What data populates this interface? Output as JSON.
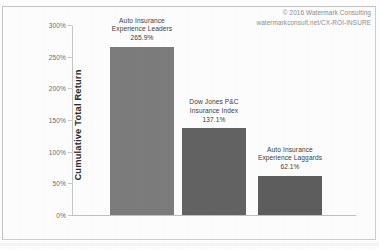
{
  "credit": {
    "copyright": "© 2016 Watermark Consulting",
    "url": "watermarkconsult.net/CX-ROI-INSURE"
  },
  "chart_data": {
    "type": "bar",
    "title": "",
    "xlabel": "",
    "ylabel": "Cumulative Total Return",
    "ylim": [
      0,
      300
    ],
    "grid": false,
    "legend": "none",
    "ytick_labels": [
      "0%",
      "50%",
      "100%",
      "150%",
      "200%",
      "250%",
      "300%"
    ],
    "ytick_values": [
      0,
      50,
      100,
      150,
      200,
      250,
      300
    ],
    "categories": [
      "Auto Insurance Experience Leaders",
      "Dow Jones P&C Insurance Index",
      "Auto Insurance Experience Laggards"
    ],
    "values": [
      265.9,
      137.1,
      62.1
    ],
    "value_labels": [
      "265.9%",
      "137.1%",
      "62.1%"
    ],
    "bars": [
      {
        "name": "auto-insurance-experience-leaders",
        "line1": "Auto Insurance",
        "line2": "Experience Leaders",
        "value_label": "265.9%",
        "value": 265.9,
        "color": "#7d7d7d"
      },
      {
        "name": "dow-jones-pc-insurance-index",
        "line1": "Dow Jones P&C",
        "line2": "Insurance Index",
        "value_label": "137.1%",
        "value": 137.1,
        "color": "#636363"
      },
      {
        "name": "auto-insurance-experience-laggards",
        "line1": "Auto Insurance",
        "line2": "Experience Laggards",
        "value_label": "62.1%",
        "value": 62.1,
        "color": "#5e5e5e"
      }
    ]
  }
}
